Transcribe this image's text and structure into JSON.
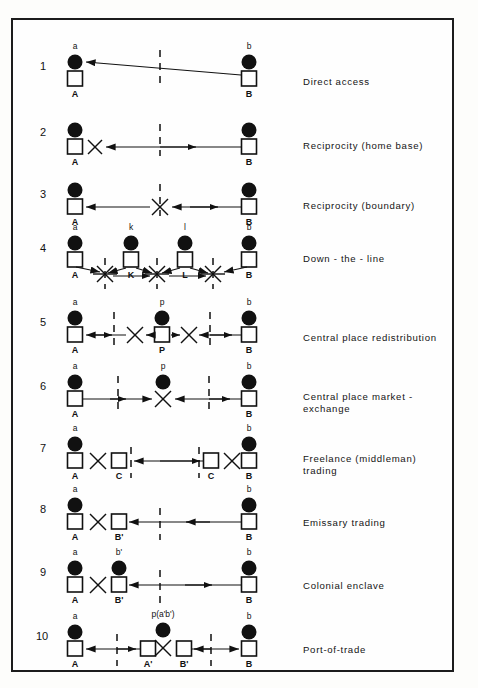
{
  "figure": {
    "type": "schematic-diagram",
    "frame": {
      "border_color": "#1c1c1c",
      "background": "#fefefe"
    },
    "legend_symbols": {
      "filled_circle": "person / individual (lowercase letter)",
      "open_square": "place / settlement (uppercase letter)",
      "dashed_vertical_line": "territorial boundary",
      "x_cross": "transaction / exchange point",
      "arrow": "movement direction"
    }
  },
  "rows": [
    {
      "index": "1",
      "label": "Direct access",
      "nodes": [
        {
          "id": "A",
          "upper": "a",
          "lower": "A",
          "kind": "circle-square"
        },
        {
          "id": "B",
          "upper": "b",
          "lower": "B",
          "kind": "circle-square"
        }
      ],
      "boundaries": 1,
      "crosses": 0
    },
    {
      "index": "2",
      "label": "Reciprocity (home base)",
      "nodes": [
        {
          "id": "A",
          "upper": "",
          "lower": "A",
          "kind": "circle-square"
        },
        {
          "id": "B",
          "upper": "",
          "lower": "B",
          "kind": "circle-square"
        }
      ],
      "boundaries": 1,
      "crosses": 1
    },
    {
      "index": "3",
      "label": "Reciprocity (boundary)",
      "nodes": [
        {
          "id": "A",
          "upper": "",
          "lower": "A",
          "kind": "circle-square"
        },
        {
          "id": "B",
          "upper": "",
          "lower": "B",
          "kind": "circle-square"
        }
      ],
      "boundaries": 1,
      "crosses": 1
    },
    {
      "index": "4",
      "label": "Down - the - line",
      "nodes": [
        {
          "id": "A",
          "upper": "a",
          "lower": "A",
          "kind": "circle-square"
        },
        {
          "id": "K",
          "upper": "k",
          "lower": "K",
          "kind": "circle-square"
        },
        {
          "id": "L",
          "upper": "l",
          "lower": "L",
          "kind": "circle-square"
        },
        {
          "id": "B",
          "upper": "b",
          "lower": "B",
          "kind": "circle-square"
        }
      ],
      "boundaries": 3,
      "crosses": 3
    },
    {
      "index": "5",
      "label": "Central place redistribution",
      "nodes": [
        {
          "id": "A",
          "upper": "a",
          "lower": "A",
          "kind": "circle-square"
        },
        {
          "id": "P",
          "upper": "p",
          "lower": "P",
          "kind": "circle-square"
        },
        {
          "id": "B",
          "upper": "b",
          "lower": "B",
          "kind": "circle-square"
        }
      ],
      "boundaries": 2,
      "crosses": 2
    },
    {
      "index": "6",
      "label": "Central place market -\nexchange",
      "nodes": [
        {
          "id": "A",
          "upper": "a",
          "lower": "A",
          "kind": "circle-square"
        },
        {
          "id": "P",
          "upper": "p",
          "lower": "",
          "kind": "circle-only"
        },
        {
          "id": "B",
          "upper": "b",
          "lower": "B",
          "kind": "circle-square"
        }
      ],
      "boundaries": 2,
      "crosses": 1
    },
    {
      "index": "7",
      "label": "Freelance (middleman)\ntrading",
      "nodes": [
        {
          "id": "A",
          "upper": "a",
          "lower": "A",
          "kind": "circle-square"
        },
        {
          "id": "C1",
          "upper": "",
          "lower": "C",
          "kind": "square-only"
        },
        {
          "id": "C2",
          "upper": "",
          "lower": "C",
          "kind": "square-only"
        },
        {
          "id": "B",
          "upper": "b",
          "lower": "B",
          "kind": "circle-square"
        }
      ],
      "boundaries": 2,
      "crosses": 2
    },
    {
      "index": "8",
      "label": "Emissary trading",
      "nodes": [
        {
          "id": "A",
          "upper": "a",
          "lower": "A",
          "kind": "circle-square"
        },
        {
          "id": "Bp",
          "upper": "",
          "lower": "B'",
          "kind": "square-only"
        },
        {
          "id": "B",
          "upper": "",
          "lower": "B",
          "kind": "circle-square"
        }
      ],
      "boundaries": 1,
      "crosses": 1
    },
    {
      "index": "9",
      "label": "Colonial enclave",
      "nodes": [
        {
          "id": "A",
          "upper": "a",
          "lower": "A",
          "kind": "circle-square"
        },
        {
          "id": "Bp",
          "upper": "b'",
          "lower": "B'",
          "kind": "circle-square"
        },
        {
          "id": "B",
          "upper": "b",
          "lower": "B",
          "kind": "circle-square"
        }
      ],
      "boundaries": 1,
      "crosses": 1
    },
    {
      "index": "10",
      "label": "Port-of-trade",
      "nodes": [
        {
          "id": "A",
          "upper": "a",
          "lower": "A",
          "kind": "circle-square"
        },
        {
          "id": "Ap",
          "upper": "",
          "lower": "A'",
          "kind": "square-only"
        },
        {
          "id": "P",
          "upper": "p(a'b')",
          "lower": "",
          "kind": "circle-only"
        },
        {
          "id": "Bp",
          "upper": "",
          "lower": "B'",
          "kind": "square-only"
        },
        {
          "id": "B",
          "upper": "b",
          "lower": "B",
          "kind": "circle-square"
        }
      ],
      "boundaries": 2,
      "crosses": 1
    }
  ]
}
